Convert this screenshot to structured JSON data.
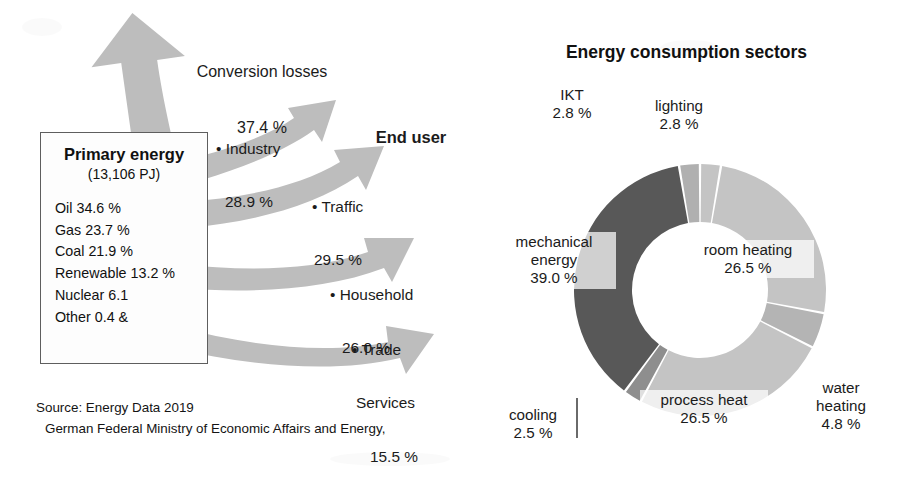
{
  "figure": {
    "left_diagram": {
      "conversion_losses": {
        "label": "Conversion losses",
        "value": "37.4 %"
      },
      "primary_energy": {
        "title": "Primary energy",
        "subtitle": "(13,106 PJ)",
        "items": [
          "Oil 34.6 %",
          "Gas 23.7 %",
          "Coal 21.9 %",
          "Renewable 13.2 %",
          "Nuclear 6.1",
          "Other 0.4 &"
        ]
      },
      "end_user_header": "End user",
      "end_users": [
        {
          "label": "• Industry",
          "value": "28.9 %"
        },
        {
          "label": "• Traffic",
          "value": "29.5 %"
        },
        {
          "label": "• Household",
          "value": "26.0 %"
        },
        {
          "label": "• Trade",
          "label2": "Services",
          "value": "15.5 %"
        }
      ]
    },
    "source": {
      "line1": "Source: Energy Data 2019",
      "line2": "German Federal Ministry of Economic Affairs and Energy,"
    },
    "right_chart_title": "Energy consumption sectors"
  },
  "chart_data": {
    "type": "pie",
    "title": "Energy consumption sectors",
    "subtype": "donut",
    "unit": "%",
    "legend": "none",
    "labels_position": "around-slices",
    "start_angle_deg": 0,
    "direction": "clockwise",
    "categories": [
      "lighting",
      "room heating",
      "water heating",
      "process heat",
      "cooling",
      "mechanical energy",
      "IKT"
    ],
    "values": [
      2.8,
      26.5,
      4.8,
      26.5,
      2.5,
      39.0,
      2.8
    ],
    "value_labels": [
      "2.8 %",
      "26.5 %",
      "4.8 %",
      "26.5 %",
      "2.5 %",
      "39.0 %",
      "2.8 %"
    ],
    "colors": [
      "#c4c4c4",
      "#c4c4c4",
      "#b4b4b4",
      "#c4c4c4",
      "#8e8e8e",
      "#585858",
      "#b0b0b0"
    ],
    "slices": [
      {
        "name": "lighting",
        "value": 2.8,
        "value_label": "2.8 %",
        "color": "#c4c4c4"
      },
      {
        "name": "room heating",
        "value": 26.5,
        "value_label": "26.5 %",
        "color": "#c4c4c4"
      },
      {
        "name": "water heating",
        "value": 4.8,
        "value_label": "4.8 %",
        "color": "#b4b4b4"
      },
      {
        "name": "process heat",
        "value": 26.5,
        "value_label": "26.5 %",
        "color": "#c4c4c4"
      },
      {
        "name": "cooling",
        "value": 2.5,
        "value_label": "2.5 %",
        "color": "#8e8e8e"
      },
      {
        "name": "mechanical energy",
        "value": 39.0,
        "value_label": "39.0 %",
        "color": "#585858"
      },
      {
        "name": "IKT",
        "value": 2.8,
        "value_label": "2.8 %",
        "color": "#b0b0b0"
      }
    ]
  },
  "flow_data": {
    "type": "sankey-arrows",
    "total_label": "(13,106 PJ)",
    "inputs": [
      {
        "name": "Oil",
        "value": 34.6,
        "label": "Oil 34.6 %"
      },
      {
        "name": "Gas",
        "value": 23.7,
        "label": "Gas 23.7 %"
      },
      {
        "name": "Coal",
        "value": 21.9,
        "label": "Coal 21.9 %"
      },
      {
        "name": "Renewable",
        "value": 13.2,
        "label": "Renewable 13.2 %"
      },
      {
        "name": "Nuclear",
        "value": 6.1,
        "label": "Nuclear 6.1"
      },
      {
        "name": "Other",
        "value": 0.4,
        "label": "Other 0.4 &"
      }
    ],
    "losses": {
      "name": "Conversion losses",
      "value": 37.4,
      "label": "37.4 %"
    },
    "outputs": [
      {
        "name": "Industry",
        "value": 28.9,
        "label": "28.9 %"
      },
      {
        "name": "Traffic",
        "value": 29.5,
        "label": "29.5 %"
      },
      {
        "name": "Household",
        "value": 26.0,
        "label": "26.0 %"
      },
      {
        "name": "Trade Services",
        "value": 15.5,
        "label": "15.5 %"
      }
    ],
    "arrow_color": "#bdbdbd"
  },
  "colors": {
    "arrow_gray": "#bdbdbd",
    "slice_light": "#c4c4c4",
    "slice_mid": "#a9a9a9",
    "slice_dark": "#585858",
    "text": "#1b1b1b",
    "box_border": "#5e5e5e"
  }
}
